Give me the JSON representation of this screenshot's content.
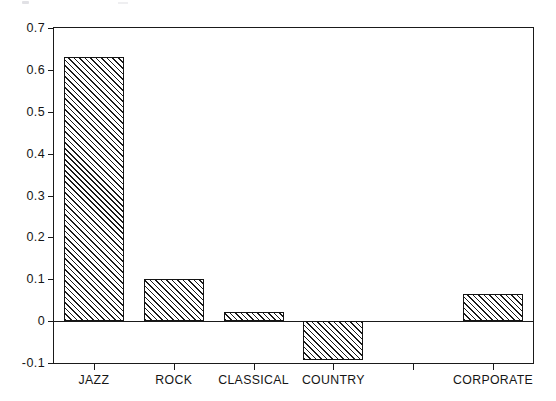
{
  "chart_data": {
    "type": "bar",
    "title": "",
    "subtitle": "",
    "xlabel": "",
    "ylabel": "",
    "categories": [
      "JAZZ",
      "ROCK",
      "CLASSICAL",
      "COUNTRY",
      "",
      "CORPORATE"
    ],
    "values": [
      0.63,
      0.1,
      0.022,
      -0.092,
      0,
      0.065
    ],
    "ylim": [
      -0.1,
      0.7
    ],
    "yticks": [
      -0.1,
      0,
      0.1,
      0.2,
      0.3,
      0.4,
      0.5,
      0.6,
      0.7
    ],
    "ytick_labels": [
      "-0.1",
      "0",
      "0.1",
      "0.2",
      "0.3",
      "0.4",
      "0.5",
      "0.6",
      "0.7"
    ],
    "xtick_labels": [
      "JAZZ",
      "ROCK",
      "CLASSICAL",
      "COUNTRY",
      "",
      "CORPORATE"
    ],
    "grid": false,
    "legend": null,
    "legend_position": "none",
    "annotations": [],
    "bar_style": {
      "fill": "diagonal-hatch",
      "hatch_angle_deg": 45,
      "edge_color": "#141414",
      "face_color": "#ffffff"
    },
    "axes_style": {
      "frame": "box",
      "axis_color": "#1a1a1a",
      "background": "#ffffff",
      "zero_line": true
    }
  }
}
